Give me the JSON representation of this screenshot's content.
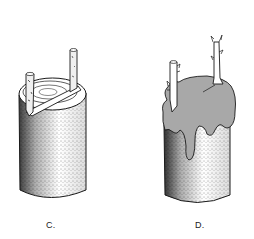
{
  "figures": [
    {
      "id": "C",
      "label": "C.",
      "description": "Cylindrical stem section with a diagonal cleft cut across the top and two scion sticks inserted at each side of the cleft"
    },
    {
      "id": "D",
      "label": "D.",
      "description": "Same stem section with the top covered in grafting wax dripping down the sides; two scions with buds protruding through the wax"
    }
  ],
  "colors": {
    "background": "#ffffff",
    "line": "#1a1a1a",
    "wax": "#a8a8a8",
    "stipple": "#333333"
  }
}
